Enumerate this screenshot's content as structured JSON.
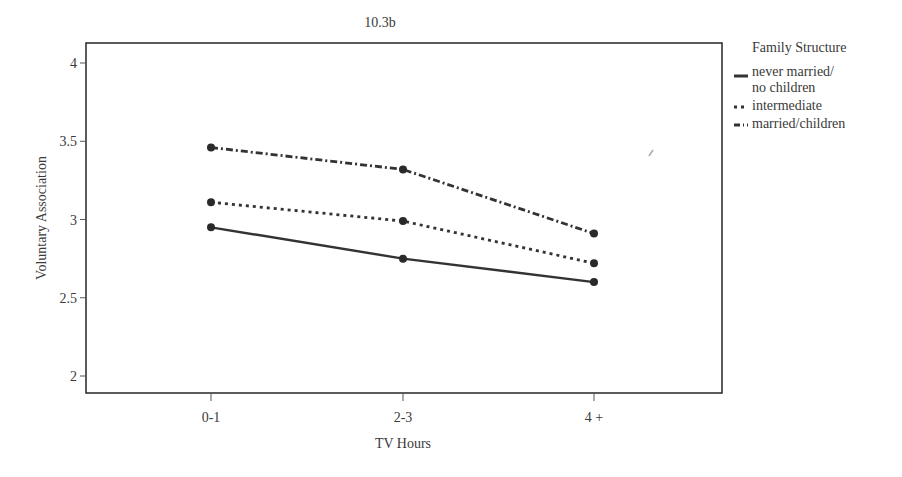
{
  "chart_data": {
    "type": "line",
    "title": "10.3b",
    "xlabel": "TV Hours",
    "ylabel": "Voluntary Association",
    "categories": [
      "0-1",
      "2-3",
      "4 +"
    ],
    "ylim": [
      1.9,
      4.13
    ],
    "yticks": [
      2,
      2.5,
      3,
      3.5,
      4
    ],
    "ytick_labels": [
      "2",
      "2.5",
      "3",
      "3.5",
      "4"
    ],
    "grid": false,
    "legend_position": "right",
    "legend_title": "Family Structure",
    "series": [
      {
        "name": "never married/\nno children",
        "style": "solid",
        "values": [
          2.95,
          2.75,
          2.6
        ]
      },
      {
        "name": "intermediate",
        "style": "dotted",
        "values": [
          3.11,
          2.99,
          2.72
        ]
      },
      {
        "name": "married/children",
        "style": "dashdot",
        "values": [
          3.46,
          3.32,
          2.91
        ]
      }
    ]
  },
  "legend": {
    "title": "Family Structure",
    "items": [
      {
        "label": "never married/\nno children"
      },
      {
        "label": "intermediate"
      },
      {
        "label": "married/children"
      }
    ]
  }
}
